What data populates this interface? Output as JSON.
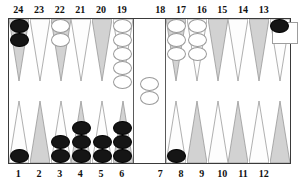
{
  "board": {
    "type": "backgammon-board",
    "colors": {
      "dark_point": "#d2d2d2",
      "light_point": "#fdfdfd",
      "black_checker": "#151515",
      "white_checker": "#ffffff",
      "frame": "#3a3a3a",
      "background": "#ffffff"
    },
    "top_labels": [
      "24",
      "23",
      "22",
      "21",
      "20",
      "19",
      "18",
      "17",
      "16",
      "15",
      "14",
      "13"
    ],
    "bottom_labels": [
      "1",
      "2",
      "3",
      "4",
      "5",
      "6",
      "7",
      "8",
      "9",
      "10",
      "11",
      "12"
    ],
    "points": [
      {
        "number": "24",
        "row": "top",
        "half": "left",
        "shade": "dark",
        "checkers": 2,
        "color": "black"
      },
      {
        "number": "23",
        "row": "top",
        "half": "left",
        "shade": "light",
        "checkers": 0,
        "color": "none"
      },
      {
        "number": "22",
        "row": "top",
        "half": "left",
        "shade": "dark",
        "checkers": 2,
        "color": "white"
      },
      {
        "number": "21",
        "row": "top",
        "half": "left",
        "shade": "light",
        "checkers": 0,
        "color": "none"
      },
      {
        "number": "20",
        "row": "top",
        "half": "left",
        "shade": "dark",
        "checkers": 0,
        "color": "none"
      },
      {
        "number": "19",
        "row": "top",
        "half": "left",
        "shade": "light",
        "checkers": 5,
        "color": "white"
      },
      {
        "number": "18",
        "row": "top",
        "half": "right",
        "shade": "dark",
        "checkers": 3,
        "color": "white"
      },
      {
        "number": "17",
        "row": "top",
        "half": "right",
        "shade": "light",
        "checkers": 3,
        "color": "white"
      },
      {
        "number": "16",
        "row": "top",
        "half": "right",
        "shade": "dark",
        "checkers": 0,
        "color": "none"
      },
      {
        "number": "15",
        "row": "top",
        "half": "right",
        "shade": "light",
        "checkers": 0,
        "color": "none"
      },
      {
        "number": "14",
        "row": "top",
        "half": "right",
        "shade": "dark",
        "checkers": 0,
        "color": "none"
      },
      {
        "number": "13",
        "row": "top",
        "half": "right",
        "shade": "light",
        "checkers": 1,
        "color": "black"
      },
      {
        "number": "1",
        "row": "bottom",
        "half": "left",
        "shade": "light",
        "checkers": 1,
        "color": "black"
      },
      {
        "number": "2",
        "row": "bottom",
        "half": "left",
        "shade": "dark",
        "checkers": 0,
        "color": "none"
      },
      {
        "number": "3",
        "row": "bottom",
        "half": "left",
        "shade": "light",
        "checkers": 2,
        "color": "black"
      },
      {
        "number": "4",
        "row": "bottom",
        "half": "left",
        "shade": "dark",
        "checkers": 3,
        "color": "black"
      },
      {
        "number": "5",
        "row": "bottom",
        "half": "left",
        "shade": "light",
        "checkers": 2,
        "color": "black"
      },
      {
        "number": "6",
        "row": "bottom",
        "half": "left",
        "shade": "dark",
        "checkers": 3,
        "color": "black"
      },
      {
        "number": "7",
        "row": "bottom",
        "half": "right",
        "shade": "light",
        "checkers": 1,
        "color": "black"
      },
      {
        "number": "8",
        "row": "bottom",
        "half": "right",
        "shade": "dark",
        "checkers": 0,
        "color": "none"
      },
      {
        "number": "9",
        "row": "bottom",
        "half": "right",
        "shade": "light",
        "checkers": 0,
        "color": "none"
      },
      {
        "number": "10",
        "row": "bottom",
        "half": "right",
        "shade": "dark",
        "checkers": 0,
        "color": "none"
      },
      {
        "number": "11",
        "row": "bottom",
        "half": "right",
        "shade": "light",
        "checkers": 0,
        "color": "none"
      },
      {
        "number": "12",
        "row": "bottom",
        "half": "right",
        "shade": "dark",
        "checkers": 0,
        "color": "none"
      }
    ],
    "bar": {
      "checkers": 2,
      "color": "white"
    },
    "tray": {
      "label": "",
      "checkers": 0
    }
  }
}
